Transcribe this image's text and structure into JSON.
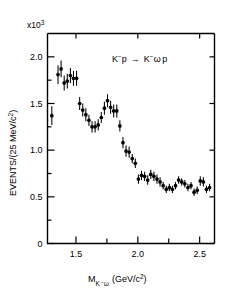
{
  "figure": {
    "multiplier_label": "x10",
    "multiplier_exp": "3",
    "annotation": "K⁻p → K⁻ω p",
    "annotation_parts": {
      "lhs_main": "K",
      "lhs_sup": "−",
      "lhs_target": "p",
      "arrow": "→",
      "rhs_main": "K",
      "rhs_sup": "−",
      "rhs_omega": "ω",
      "rhs_target": "p"
    }
  },
  "chart_data": {
    "type": "scatter",
    "title": "",
    "subtitle": "",
    "xlabel": "M_{K⁻ω}  (GeV/c²)",
    "xlabel_parts": {
      "symbol": "M",
      "subscript": "K⁻ω",
      "units": "(GeV/c",
      "units_sup": "2",
      "units_close": ")"
    },
    "ylabel": "EVENTS/(25 MeV/c²)",
    "ylabel_parts": {
      "main": "EVENTS/(25 MeV/c",
      "sup": "2",
      "close": ")"
    },
    "y_multiplier": 1000,
    "xlim": [
      1.27,
      2.62
    ],
    "ylim": [
      0,
      2.25
    ],
    "xticks_major": [
      1.5,
      2.0,
      2.5
    ],
    "xticks_major_labels": [
      "1.5",
      "2.0",
      "2.5"
    ],
    "xticks_minor": [
      1.75,
      2.25
    ],
    "yticks_major": [
      0,
      0.5,
      1.0,
      1.5,
      2.0
    ],
    "yticks_major_labels": [
      "0",
      "0.5",
      "1.0",
      "1.5",
      "2.0"
    ],
    "yticks_minor": [
      0.25,
      0.75,
      1.25,
      1.75
    ],
    "grid": false,
    "legend": "none",
    "bin_width": 0.025,
    "series": [
      {
        "name": "K⁻ω effective mass",
        "marker": "filled-circle",
        "color": "#000000",
        "x": [
          1.305,
          1.355,
          1.38,
          1.405,
          1.43,
          1.455,
          1.48,
          1.505,
          1.53,
          1.555,
          1.58,
          1.605,
          1.63,
          1.655,
          1.68,
          1.705,
          1.73,
          1.755,
          1.78,
          1.805,
          1.83,
          1.855,
          1.88,
          1.905,
          1.93,
          1.955,
          1.98,
          2.005,
          2.03,
          2.055,
          2.08,
          2.105,
          2.13,
          2.155,
          2.18,
          2.205,
          2.23,
          2.255,
          2.28,
          2.305,
          2.33,
          2.355,
          2.38,
          2.405,
          2.43,
          2.455,
          2.48,
          2.505,
          2.53,
          2.555,
          2.58
        ],
        "y": [
          1.37,
          1.81,
          1.87,
          1.72,
          1.74,
          1.8,
          1.77,
          1.77,
          1.5,
          1.43,
          1.38,
          1.32,
          1.25,
          1.25,
          1.27,
          1.35,
          1.45,
          1.53,
          1.46,
          1.42,
          1.42,
          1.26,
          1.08,
          0.99,
          0.98,
          0.91,
          0.86,
          0.69,
          0.73,
          0.72,
          0.68,
          0.74,
          0.72,
          0.69,
          0.66,
          0.62,
          0.58,
          0.6,
          0.58,
          0.62,
          0.68,
          0.66,
          0.64,
          0.6,
          0.62,
          0.55,
          0.57,
          0.67,
          0.66,
          0.58,
          0.6
        ],
        "yerr": [
          0.1,
          0.1,
          0.09,
          0.08,
          0.08,
          0.08,
          0.08,
          0.08,
          0.07,
          0.07,
          0.07,
          0.06,
          0.06,
          0.06,
          0.06,
          0.06,
          0.07,
          0.07,
          0.07,
          0.07,
          0.07,
          0.06,
          0.06,
          0.06,
          0.06,
          0.05,
          0.05,
          0.05,
          0.05,
          0.05,
          0.05,
          0.05,
          0.05,
          0.05,
          0.05,
          0.04,
          0.04,
          0.04,
          0.04,
          0.04,
          0.04,
          0.04,
          0.04,
          0.04,
          0.04,
          0.04,
          0.04,
          0.05,
          0.05,
          0.04,
          0.04
        ]
      }
    ]
  }
}
